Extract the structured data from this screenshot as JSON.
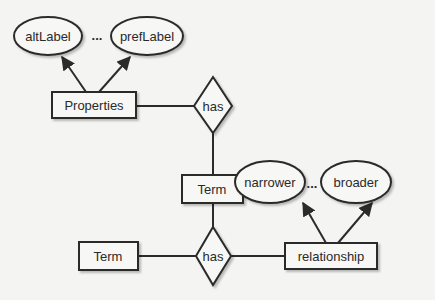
{
  "diagram": {
    "type": "entity-relationship",
    "colors": {
      "background": "#f4f4f2",
      "stroke": "#2b2b2b",
      "fill": "#f7f7f5",
      "text": "#2a2a2a"
    },
    "entities": [
      {
        "id": "properties",
        "label": "Properties"
      },
      {
        "id": "term_mid",
        "label": "Term"
      },
      {
        "id": "term_left",
        "label": "Term"
      },
      {
        "id": "relationship",
        "label": "relationship"
      }
    ],
    "relations": [
      {
        "id": "has_top",
        "label": "has"
      },
      {
        "id": "has_bottom",
        "label": "has"
      }
    ],
    "attributes": [
      {
        "id": "altLabel",
        "label": "altLabel",
        "parent": "properties"
      },
      {
        "id": "prefLabel",
        "label": "prefLabel",
        "parent": "properties"
      },
      {
        "id": "narrower",
        "label": "narrower",
        "parent": "relationship"
      },
      {
        "id": "broader",
        "label": "broader",
        "parent": "relationship"
      }
    ],
    "ellipsis_top": "...",
    "ellipsis_bottom": "...",
    "edges": [
      {
        "from": "properties",
        "to": "altLabel",
        "arrow": true
      },
      {
        "from": "properties",
        "to": "prefLabel",
        "arrow": true
      },
      {
        "from": "properties",
        "to": "has_top",
        "arrow": false
      },
      {
        "from": "has_top",
        "to": "term_mid",
        "arrow": false
      },
      {
        "from": "term_mid",
        "to": "has_bottom",
        "arrow": false
      },
      {
        "from": "term_left",
        "to": "has_bottom",
        "arrow": false
      },
      {
        "from": "has_bottom",
        "to": "relationship",
        "arrow": false
      },
      {
        "from": "relationship",
        "to": "narrower",
        "arrow": true
      },
      {
        "from": "relationship",
        "to": "broader",
        "arrow": true
      }
    ]
  }
}
